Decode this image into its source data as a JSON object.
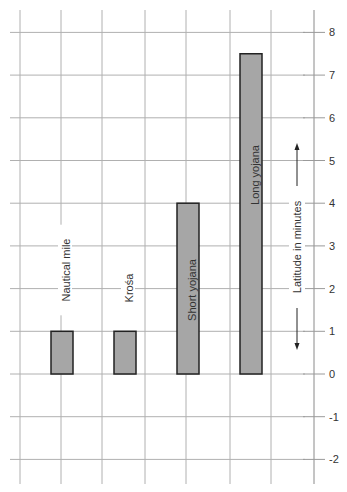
{
  "chart_data": {
    "type": "bar",
    "title": "",
    "xlabel": "",
    "ylabel": "Latitude in minutes",
    "categories": [
      "Nautical mile",
      "Krośa",
      "Short yojana",
      "Long yojana"
    ],
    "values": [
      1,
      1,
      4,
      7.5
    ],
    "ylim": [
      -2,
      8
    ],
    "yticks": [
      8,
      7,
      6,
      5,
      4,
      3,
      2,
      1,
      0,
      -1,
      -2
    ],
    "grid": true,
    "legend": null,
    "bar_color": "#a6a6a6",
    "bar_edge_color": "#222222",
    "grid_color": "#b0b0b0",
    "label_positions": [
      "above-bar",
      "above-bar",
      "inside-bar",
      "inside-bar"
    ],
    "axis_position": "right"
  }
}
